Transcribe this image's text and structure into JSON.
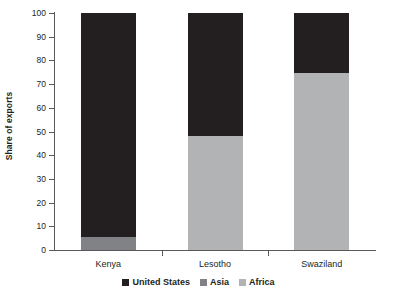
{
  "chart_data": {
    "type": "bar",
    "subtype": "stacked-bar",
    "title": "",
    "xlabel": "",
    "ylabel": "Share of exports",
    "ylim": [
      0,
      100
    ],
    "yticks": [
      0,
      10,
      20,
      30,
      40,
      50,
      60,
      70,
      80,
      90,
      100
    ],
    "ytick_labels": [
      "0",
      "10",
      "20",
      "30",
      "40",
      "50",
      "60",
      "70",
      "80",
      "90",
      "100"
    ],
    "grid": false,
    "legend_position": "bottom-center",
    "categories": [
      "Kenya",
      "Lesotho",
      "Swaziland"
    ],
    "series": [
      {
        "name": "United States",
        "color": "#231f20",
        "values": [
          94.5,
          52,
          25.5
        ]
      },
      {
        "name": "Asia",
        "color": "#808285",
        "values": [
          5.5,
          0,
          0
        ]
      },
      {
        "name": "Africa",
        "color": "#b2b3b5",
        "values": [
          0,
          48,
          74.5
        ]
      }
    ],
    "stack_order": [
      "Asia",
      "Africa",
      "United States"
    ]
  },
  "axis": {
    "y_title": "Share of exports"
  },
  "legend": {
    "items": [
      {
        "label": "United States",
        "color": "#231f20"
      },
      {
        "label": "Asia",
        "color": "#808285"
      },
      {
        "label": "Africa",
        "color": "#b2b3b5"
      }
    ]
  },
  "colors": {
    "axis": "#58595b",
    "text": "#231f20",
    "background": "#ffffff",
    "united_states": "#231f20",
    "asia": "#808285",
    "africa": "#b2b3b5"
  }
}
